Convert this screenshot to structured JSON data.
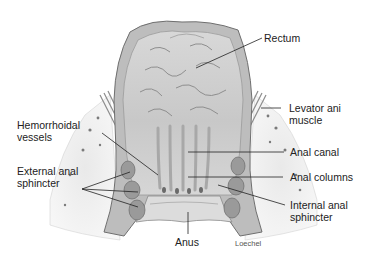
{
  "figure": {
    "credit": "Loechel",
    "colors": {
      "background": "#ffffff",
      "label_text": "#222222",
      "leader_line": "#222222",
      "tissue_light": "#e4e4e4",
      "tissue_mid": "#c2c2c2",
      "tissue_dark": "#8a8a8a"
    }
  },
  "labels": {
    "rectum": {
      "lines": [
        "Rectum"
      ]
    },
    "levator_ani": {
      "lines": [
        "Levator ani",
        "muscle"
      ]
    },
    "hemorrhoidal_vessels": {
      "lines": [
        "Hemorrhoidal",
        "vessels"
      ]
    },
    "anal_canal": {
      "lines": [
        "Anal canal"
      ]
    },
    "external_anal_sphincter": {
      "lines": [
        "External anal",
        "sphincter"
      ]
    },
    "anal_columns": {
      "lines": [
        "Anal columns"
      ]
    },
    "internal_anal_sphincter": {
      "lines": [
        "Internal anal",
        "sphincter"
      ]
    },
    "anus": {
      "lines": [
        "Anus"
      ]
    }
  }
}
